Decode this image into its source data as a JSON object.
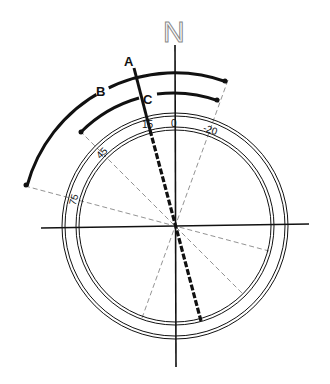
{
  "diagram": {
    "north_label": "N",
    "line_labels": {
      "A": "A",
      "B": "B",
      "C": "C"
    },
    "scale_labels": {
      "t0": "0",
      "t15": "15",
      "tm20": "-20",
      "t45": "45",
      "t75": "75"
    },
    "geometry": {
      "center": [
        175,
        226
      ],
      "inner_ring_radius": 98,
      "outer_ring_radius": 112,
      "arc_B_radius": 153,
      "arc_C_radius": 133,
      "line_A_angle_deg": 15,
      "arc_B_range_deg": [
        -20,
        75
      ],
      "arc_C_range_deg": [
        -20,
        45
      ],
      "reference_angles_deg": [
        -20,
        45,
        75
      ]
    },
    "colors": {
      "ink": "#111111",
      "dash": "#777777",
      "north_outline": "#888888",
      "background": "#ffffff"
    }
  }
}
